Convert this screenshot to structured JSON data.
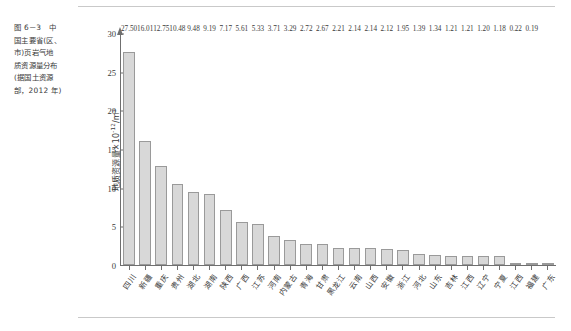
{
  "figure": {
    "caption_lines": [
      "图 6－3　中",
      "国主要省(区、",
      "市)页岩气地",
      "质资源量分布",
      "(据国土资源",
      "部，2012 年)"
    ]
  },
  "chart_data": {
    "type": "bar",
    "xlabel": "",
    "ylabel": "地质资源量×10⁻¹²/m³",
    "ylabel_base": "地质资源量×10",
    "ylabel_exp": "-12",
    "ylabel_unit": "/m³",
    "ylim": [
      0,
      30
    ],
    "yticks": [
      0,
      5,
      10,
      15,
      20,
      25,
      30
    ],
    "grid": false,
    "legend": "none",
    "source": "据国土资源部，2012 年",
    "categories": [
      "四川",
      "新疆",
      "重庆",
      "贵州",
      "湖北",
      "湖南",
      "陕西",
      "广西",
      "江苏",
      "河南",
      "内蒙古",
      "青海",
      "甘肃",
      "黑龙江",
      "云南",
      "山西",
      "安徽",
      "浙江",
      "河北",
      "山东",
      "吉林",
      "江西",
      "辽宁",
      "宁夏",
      "江西",
      "福建",
      "广东"
    ],
    "values": [
      27.5,
      16.01,
      12.75,
      10.48,
      9.48,
      9.19,
      7.17,
      5.61,
      5.33,
      3.71,
      3.29,
      2.72,
      2.67,
      2.21,
      2.14,
      2.14,
      2.12,
      1.95,
      1.39,
      1.34,
      1.21,
      1.21,
      1.2,
      1.18,
      0.22,
      0.19,
      0.19
    ],
    "value_labels": [
      "27.50",
      "16.01",
      "12.75",
      "10.48",
      "9.48",
      "9.19",
      "7.17",
      "5.61",
      "5.33",
      "3.71",
      "3.29",
      "2.72",
      "2.67",
      "2.21",
      "2.14",
      "2.14",
      "2.12",
      "1.95",
      "1.39",
      "1.34",
      "1.21",
      "1.21",
      "1.20",
      "1.18",
      "0.22",
      "0.19",
      ""
    ]
  }
}
